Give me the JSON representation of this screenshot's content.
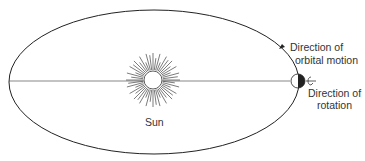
{
  "diagram": {
    "labels": {
      "sun": "Sun",
      "orbital_motion_line1": "Direction of",
      "orbital_motion_line2": "orbital motion",
      "rotation_line1": "Direction of",
      "rotation_line2": "rotation"
    },
    "colors": {
      "line": "#222222",
      "earth_shadow": "#222222",
      "background": "#ffffff"
    }
  }
}
